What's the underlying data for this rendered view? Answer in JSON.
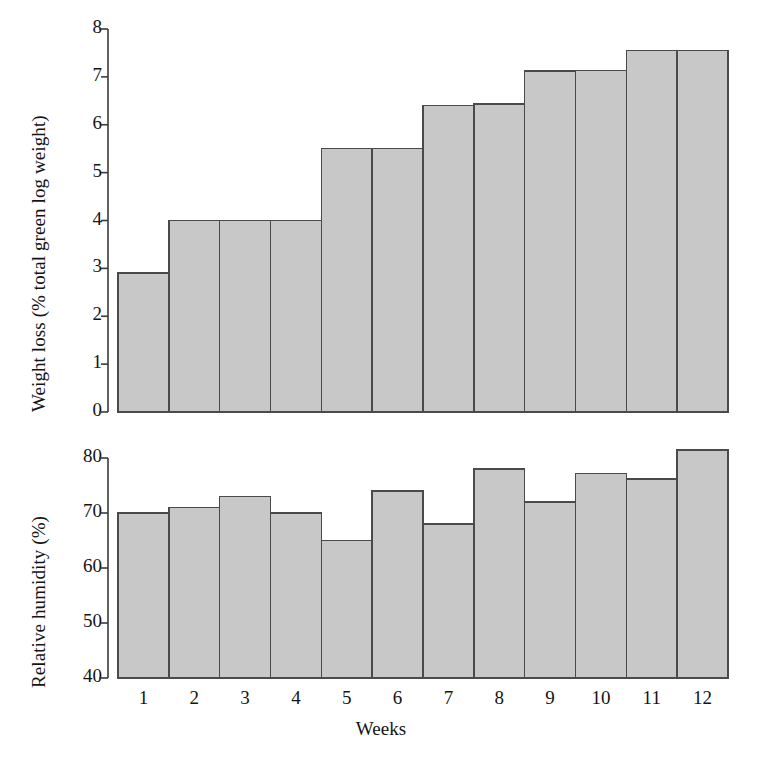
{
  "figure": {
    "width": 762,
    "height": 761,
    "background": "#ffffff",
    "bar_fill": "#c8c8c8",
    "bar_stroke": "#4a4a4a",
    "axis_color": "#3a3a3a",
    "text_color": "#141414"
  },
  "xaxis": {
    "label": "Weeks",
    "tick_labels": [
      "1",
      "2",
      "3",
      "4",
      "5",
      "6",
      "7",
      "8",
      "9",
      "10",
      "11",
      "12"
    ]
  },
  "top_panel": {
    "ylabel": "Weight loss (% total green log weight)",
    "ytick_labels": [
      "0",
      "1",
      "2",
      "3",
      "4",
      "5",
      "6",
      "7",
      "8"
    ]
  },
  "bottom_panel": {
    "ylabel": "Relative humidity (%)",
    "ytick_labels": [
      "40",
      "50",
      "60",
      "70",
      "80"
    ]
  },
  "caption": {
    "text": ""
  },
  "chart_data": [
    {
      "type": "bar",
      "id": "weight-loss",
      "title": "",
      "xlabel": "Weeks",
      "ylabel": "Weight loss (% total green log weight)",
      "categories": [
        "1",
        "2",
        "3",
        "4",
        "5",
        "6",
        "7",
        "8",
        "9",
        "10",
        "11",
        "12"
      ],
      "values": [
        2.9,
        4.0,
        4.0,
        4.0,
        5.5,
        5.5,
        6.4,
        6.43,
        7.12,
        7.13,
        7.55,
        7.55
      ],
      "ylim": [
        0,
        8
      ],
      "yticks": [
        0,
        1,
        2,
        3,
        4,
        5,
        6,
        7,
        8
      ],
      "grid": false,
      "legend": false
    },
    {
      "type": "bar",
      "id": "relative-humidity",
      "title": "",
      "xlabel": "Weeks",
      "ylabel": "Relative humidity (%)",
      "categories": [
        "1",
        "2",
        "3",
        "4",
        "5",
        "6",
        "7",
        "8",
        "9",
        "10",
        "11",
        "12"
      ],
      "values": [
        70,
        71,
        73,
        70,
        65,
        74,
        68,
        78,
        72,
        77.2,
        76.2,
        81.5
      ],
      "ylim": [
        40,
        80
      ],
      "yticks": [
        40,
        50,
        60,
        70,
        80
      ],
      "grid": false,
      "legend": false
    }
  ]
}
